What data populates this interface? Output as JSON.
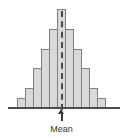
{
  "chart_data": {
    "type": "bar",
    "title": "",
    "subtitle": "",
    "xlabel": "",
    "ylabel": "",
    "grid": false,
    "legend": false,
    "categories": [
      "1",
      "2",
      "3",
      "4",
      "5",
      "6",
      "7",
      "8",
      "9",
      "10",
      "11"
    ],
    "values": [
      1,
      2,
      4,
      6,
      8,
      10,
      8,
      6,
      4,
      2,
      1
    ],
    "ylim": [
      0,
      10
    ],
    "xlim": [
      0,
      11
    ],
    "series": [
      {
        "name": "Frequency",
        "values": [
          1,
          2,
          4,
          6,
          8,
          10,
          8,
          6,
          4,
          2,
          1
        ]
      }
    ],
    "annotations": [
      {
        "name": "mean",
        "label": "Mean",
        "x_category": "6",
        "style": "dashed-vertical-line-with-up-arrow"
      }
    ],
    "colors": {
      "bar_fill": "#d9d9d9",
      "bar_stroke": "#808080",
      "axis": "#4d4d4d",
      "mean_line": "#4a4a4a",
      "label_text": "#333333",
      "background": "#ffffff"
    }
  },
  "annotation": {
    "mean_label": "Mean"
  }
}
